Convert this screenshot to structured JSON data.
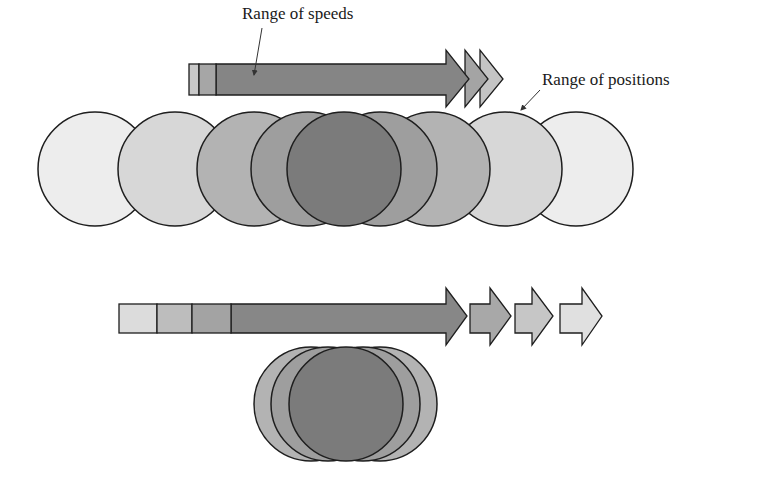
{
  "labels": {
    "speeds": "Range of speeds",
    "positions": "Range of positions"
  },
  "colors": {
    "outline": "#1e1e1e",
    "lightest": "#ececec",
    "light": "#d8d8d8",
    "medium": "#b4b4b4",
    "medium_dark": "#9d9d9d",
    "dark": "#7c7c7c"
  },
  "top_diagram": {
    "description": "Narrow range of speeds, wide range of positions",
    "speed_bar_segments": 3,
    "speed_arrow_heads": 3,
    "position_circles": 9
  },
  "bottom_diagram": {
    "description": "Wide range of speeds, narrow range of positions",
    "speed_bar_segments": 4,
    "speed_arrow_heads": 4,
    "position_circles": 5
  }
}
